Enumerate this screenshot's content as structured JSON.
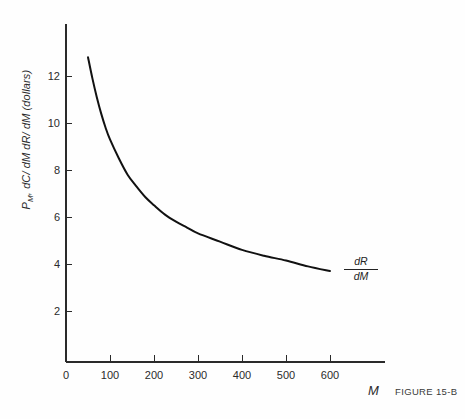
{
  "figure": {
    "caption": "FIGURE 15-B",
    "background_color": "#fefefe",
    "axis_color": "#2a2a2a",
    "curve_color": "#111111"
  },
  "axes": {
    "x_variable_label": "M",
    "y_label_parts": {
      "p": "P",
      "p_sub": "M",
      "rest": ", dC/ dM  dR/ dM (dollars)"
    },
    "y_label_full": "Pₘ, dC/dM dR/dM (dollars)"
  },
  "annotations": {
    "curve_label_numerator": "dR",
    "curve_label_denominator": "dM"
  },
  "chart_data": {
    "type": "line",
    "title": "",
    "subtitle": "",
    "xlabel": "M",
    "ylabel": "P_M, dC/dM  dR/dM (dollars)",
    "xlim": [
      0,
      725
    ],
    "ylim": [
      0,
      14.4
    ],
    "grid": false,
    "legend": "none",
    "x_ticks": [
      0,
      100,
      200,
      300,
      400,
      500,
      600
    ],
    "x_tick_labels": [
      "0",
      "100",
      "200",
      "300",
      "400",
      "500",
      "600"
    ],
    "y_ticks": [
      2,
      4,
      6,
      8,
      10,
      12
    ],
    "y_tick_labels": [
      "2",
      "4",
      "6",
      "8",
      "10",
      "12"
    ],
    "series": [
      {
        "name": "dR/dM",
        "label_numerator": "dR",
        "label_denominator": "dM",
        "color": "#111111",
        "x": [
          50,
          60,
          70,
          80,
          90,
          100,
          120,
          140,
          160,
          180,
          200,
          225,
          250,
          275,
          300,
          350,
          400,
          450,
          500,
          550,
          600
        ],
        "y": [
          12.8,
          11.9,
          11.1,
          10.4,
          9.8,
          9.3,
          8.5,
          7.8,
          7.3,
          6.85,
          6.5,
          6.1,
          5.8,
          5.55,
          5.3,
          4.95,
          4.6,
          4.35,
          4.15,
          3.9,
          3.7
        ]
      }
    ]
  },
  "geometry": {
    "origin_x": 66,
    "origin_y": 358,
    "x_axis_y": 362,
    "x_axis_right": 385,
    "y_axis_top": 24,
    "px_per_100_x": 44.0,
    "px_per_2_y": 47.0
  }
}
